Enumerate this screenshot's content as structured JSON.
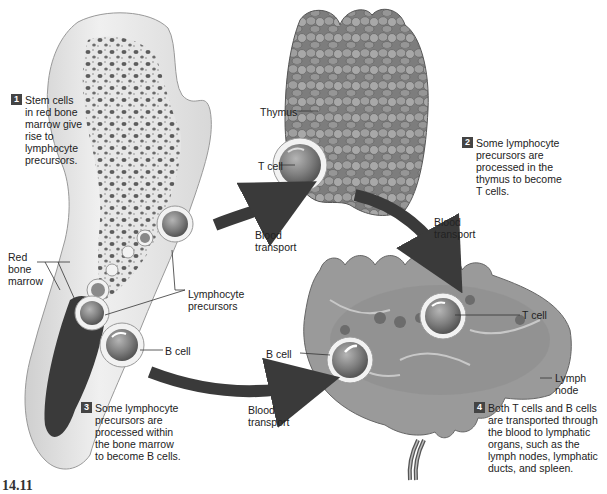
{
  "figure": {
    "number": "14.11",
    "type": "biology diagram"
  },
  "structures": {
    "bone": {
      "label_red_bone_marrow": "Red\nbone\nmarrow",
      "label_lymphocyte_precursors": "Lymphocyte\nprecursors",
      "label_b_cell": "B cell"
    },
    "thymus": {
      "label_thymus": "Thymus",
      "label_t_cell": "T cell"
    },
    "lymph_node": {
      "label_t_cell": "T cell",
      "label_b_cell": "B cell",
      "label_lymph_node": "Lymph\nnode"
    }
  },
  "arrows": [
    {
      "from": "bone",
      "to": "thymus",
      "label": "Blood\ntransport"
    },
    {
      "from": "thymus",
      "to": "lymph_node",
      "label": "Blood\ntransport"
    },
    {
      "from": "bone",
      "to": "lymph_node",
      "label": "Blood\ntransport"
    }
  ],
  "steps": [
    {
      "num": "1",
      "text": "Stem cells\nin red bone\nmarrow give\nrise to\nlymphocyte\nprecursors."
    },
    {
      "num": "2",
      "text": "Some lymphocyte\nprecursors are\nprocessed in the\nthymus to become\nT cells."
    },
    {
      "num": "3",
      "text": "Some lymphocyte\nprecursors are\nprocessed within\nthe bone marrow\nto become B cells."
    },
    {
      "num": "4",
      "text": "Both T cells and B cells\nare transported through\nthe blood to lymphatic\norgans, such as the\nlymph nodes, lymphatic\nducts, and spleen."
    }
  ],
  "colors": {
    "arrow": "#3a3a3a",
    "bone": "#e8e8e8",
    "marrow": "#3c3c3c",
    "thymus": "#8a8a8a",
    "node": "#9a9a9a",
    "cell_ring": "#f2f2f2",
    "cell_core": "#7a7a7a",
    "step_badge": "#444444"
  }
}
